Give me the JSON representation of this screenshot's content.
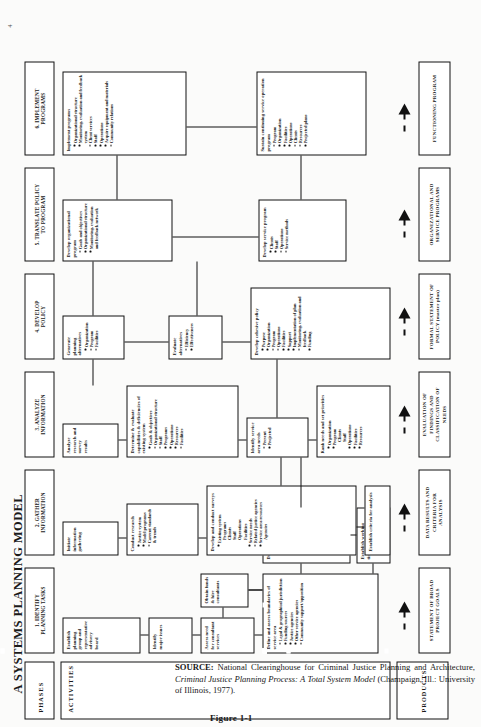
{
  "figure": {
    "title": "A SYSTEMS PLANNING MODEL",
    "caption": "Figure 1-1",
    "page_marker": "4"
  },
  "rail": {
    "phases_label": "PHASES",
    "activities_label": "ACTIVITIES",
    "products_label": "PRODUCTS"
  },
  "phases": [
    {
      "id": "p1",
      "label": "1. IDENTIFY\nPLANNING TASKS"
    },
    {
      "id": "p2",
      "label": "2. GATHER\nINFORMATION"
    },
    {
      "id": "p3",
      "label": "3. ANALYZE\nINFORMATION"
    },
    {
      "id": "p4",
      "label": "4. DEVELOP\nPOLICY"
    },
    {
      "id": "p5",
      "label": "5. TRANSLATE POLICY\nTO PROGRAM"
    },
    {
      "id": "p6",
      "label": "6. IMPLEMENT\nPROGRAMS"
    }
  ],
  "products": [
    {
      "id": "pr1",
      "label": "STATEMENT OF BROAD\nPROJECT GOALS"
    },
    {
      "id": "pr2",
      "label": "DATA RESULTS AND\nCRITERIA FOR\nANALYSIS"
    },
    {
      "id": "pr3",
      "label": "EVALUATION OF\nFINDINGS AND\nCLASSIFICATION OF\nNEEDS"
    },
    {
      "id": "pr4",
      "label": "FORMAL STATEMENT OF\nPOLICY (master plan)"
    },
    {
      "id": "pr5",
      "label": "ORGANIZATIONAL AND\nSERVICE PROGRAMS"
    },
    {
      "id": "pr6",
      "label": "FUNCTIONING PROGRAM"
    }
  ],
  "activities": {
    "a1_1": {
      "head": "Establish planning group and representative advisory board",
      "bullets": []
    },
    "a1_2": {
      "head": "Identify major issues",
      "bullets": []
    },
    "a1_3": {
      "head": "Assess need for consultant services",
      "bullets": []
    },
    "a1_4": {
      "head": "Obtain funds & hire consultants",
      "bullets": []
    },
    "a1_5": {
      "head": "Define and assess boundaries of service area",
      "bullets": [
        "Legal & geographical jurisdiction",
        "Funding sources",
        "Justice agencies",
        "Other service agencies",
        "Community support/opposition"
      ]
    },
    "a1_6": {
      "head": "Develop project goals",
      "bullets": [
        "Organization",
        "Program",
        "Operations",
        "Facilities",
        "Funding"
      ]
    },
    "a1_7": {
      "head": "Establish working timetable",
      "bullets": []
    },
    "a2_1": {
      "head": "Initiate information gathering",
      "bullets": []
    },
    "a2_2": {
      "head": "Conduct research",
      "bullets": [
        "Justice system",
        "Model programs",
        "Current standards & trends"
      ]
    },
    "a2_3": {
      "head": "Develop and conduct surveys",
      "bullets": [
        "Existing system",
        "Service needs",
        "Related justice agencies",
        "Service area resources"
      ],
      "subs": {
        "Existing system": [
          "Programs",
          "Clients",
          "Staff",
          "Operations",
          "Facilities"
        ],
        "Service area resources": [
          "Agencies"
        ]
      }
    },
    "a2_4": {
      "head": "Establish criteria for analysis",
      "bullets": []
    },
    "a3_1": {
      "head": "Analyze research and survey results",
      "bullets": []
    },
    "a3_2": {
      "head": "Determine & evaluate capabilities & deficiencies of existing system",
      "bullets": [
        "Goals & objectives",
        "Organizational structure",
        "Staff",
        "Programs",
        "Operations",
        "Resources",
        "Facilities"
      ]
    },
    "a3_3": {
      "head": "Identify service area needs",
      "bullets": [
        "Present",
        "Projected"
      ]
    },
    "a3_4": {
      "head": "Rank needs and set priorities",
      "bullets": [
        "Organization",
        "Program",
        "Operations",
        "Facilities",
        "Resources"
      ],
      "subs": {
        "Program": [
          "Clients",
          "Staff"
        ]
      }
    },
    "a4_1": {
      "head": "Generate planning alternatives",
      "bullets": [
        "Organization",
        "Program",
        "Facilities"
      ]
    },
    "a4_2": {
      "head": "Evaluate alternatives",
      "bullets": [
        "Efficiency",
        "Effectiveness"
      ]
    },
    "a4_3": {
      "head": "Develop cohesive policy",
      "bullets": [
        "Purpose",
        "Organization",
        "Program",
        "Operations",
        "Facilities",
        "Support",
        "Implementation of plan",
        "Monitoring, evaluation and feedback",
        "Funding"
      ]
    },
    "a5_1": {
      "head": "Develop organizational program",
      "bullets": [
        "Goals and objectives",
        "Organizational structure",
        "Monitoring, evaluation and feedback network"
      ]
    },
    "a5_2": {
      "head": "Develop service program",
      "bullets": [
        "Clients",
        "Staff",
        "Operations",
        "Service methods"
      ]
    },
    "a6_1": {
      "head": "Implement programs",
      "bullets": [
        "Organizational structure",
        "Monitoring, evaluation and feedback system",
        "Client services",
        "Staff",
        "Operations",
        "Acquire equipment and materials",
        "Community relations"
      ]
    },
    "a6_2": {
      "head": "Sustain continuing service operation program",
      "bullets": [
        "Program",
        "Organization",
        "Facilities",
        "Operations",
        "Clients",
        "Resources",
        "Projected plans"
      ]
    }
  },
  "source": {
    "prefix": "SOURCE:",
    "text_before": " National Clearinghouse for Criminal Justice Planning and Architecture, ",
    "italic": "Criminal Justice Planning Process: A Total System Model",
    "text_after": " (Champaign, Ill.: University of Illinois, 1977)."
  }
}
